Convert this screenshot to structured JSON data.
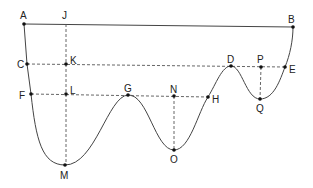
{
  "diagram": {
    "type": "curve-with-labeled-points",
    "points": {
      "A": {
        "label": "A",
        "x": 24,
        "y": 24
      },
      "B": {
        "label": "B",
        "x": 293,
        "y": 27
      },
      "J": {
        "label": "J",
        "x": 66,
        "y": 24
      },
      "C": {
        "label": "C",
        "x": 27,
        "y": 64
      },
      "K": {
        "label": "K",
        "x": 66,
        "y": 64
      },
      "D": {
        "label": "D",
        "x": 231,
        "y": 66
      },
      "P": {
        "label": "P",
        "x": 261,
        "y": 67
      },
      "E": {
        "label": "E",
        "x": 285,
        "y": 67
      },
      "F": {
        "label": "F",
        "x": 31,
        "y": 94
      },
      "L": {
        "label": "L",
        "x": 66,
        "y": 94
      },
      "G": {
        "label": "G",
        "x": 128,
        "y": 95
      },
      "N": {
        "label": "N",
        "x": 174,
        "y": 96
      },
      "H": {
        "label": "H",
        "x": 208,
        "y": 97
      },
      "M": {
        "label": "M",
        "x": 65,
        "y": 165
      },
      "O": {
        "label": "O",
        "x": 174,
        "y": 150
      },
      "Q": {
        "label": "Q",
        "x": 260,
        "y": 99
      }
    },
    "segments": {
      "solid": [
        "AB"
      ],
      "dashed": [
        "JM",
        "CE",
        "FH",
        "NO",
        "PQ"
      ]
    },
    "curve": "A-C-F-M-G-O-H-D-Q-E-B"
  }
}
